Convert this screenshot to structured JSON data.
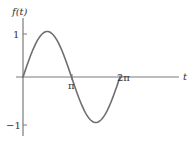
{
  "chart_data": {
    "type": "line",
    "title": "",
    "xlabel": "t",
    "ylabel": "f(t)",
    "function": "sin(t)",
    "xlim": [
      0,
      6.8
    ],
    "ylim": [
      -1.15,
      1.35
    ],
    "x_ticks": [
      {
        "value": 3.14159,
        "label": "π"
      },
      {
        "value": 6.28319,
        "label": "2π"
      }
    ],
    "y_ticks": [
      {
        "value": 1,
        "label": "1"
      },
      {
        "value": -1,
        "label": "−1"
      }
    ],
    "grid": false,
    "legend": null,
    "series": [
      {
        "name": "f(t)",
        "color": "#6e6e6e",
        "x": [
          0,
          0.7854,
          1.5708,
          2.3562,
          3.1416,
          3.927,
          4.7124,
          5.4978,
          6.2832
        ],
        "values": [
          0,
          0.707,
          1,
          0.707,
          0,
          -0.707,
          -1,
          -0.707,
          0
        ]
      }
    ]
  },
  "labels": {
    "y_axis": "f(t)",
    "x_axis": "t",
    "y_tick_1": "1",
    "y_tick_neg1": "−1",
    "x_tick_pi": "π",
    "x_tick_2pi": "2π"
  }
}
